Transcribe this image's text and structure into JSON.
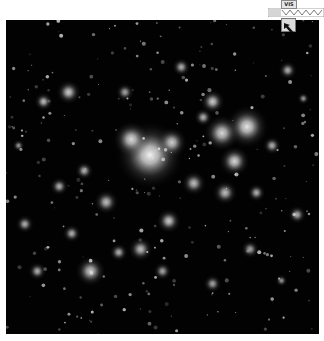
{
  "image": {
    "subject": "galaxy cluster deep-field",
    "colormap": "grayscale",
    "background_color": "#020202"
  },
  "overlay": {
    "label": "VIS",
    "cursor_icon": "pointer-arrow-icon"
  },
  "galaxies": [
    {
      "x": 0.46,
      "y": 0.43,
      "r": 0.11,
      "b": 0.95
    },
    {
      "x": 0.4,
      "y": 0.38,
      "r": 0.06,
      "b": 0.85
    },
    {
      "x": 0.53,
      "y": 0.39,
      "r": 0.05,
      "b": 0.8
    },
    {
      "x": 0.77,
      "y": 0.34,
      "r": 0.07,
      "b": 0.9
    },
    {
      "x": 0.69,
      "y": 0.36,
      "r": 0.06,
      "b": 0.85
    },
    {
      "x": 0.73,
      "y": 0.45,
      "r": 0.05,
      "b": 0.85
    },
    {
      "x": 0.66,
      "y": 0.26,
      "r": 0.04,
      "b": 0.8
    },
    {
      "x": 0.2,
      "y": 0.23,
      "r": 0.04,
      "b": 0.8
    },
    {
      "x": 0.12,
      "y": 0.26,
      "r": 0.03,
      "b": 0.75
    },
    {
      "x": 0.32,
      "y": 0.58,
      "r": 0.04,
      "b": 0.75
    },
    {
      "x": 0.52,
      "y": 0.64,
      "r": 0.04,
      "b": 0.8
    },
    {
      "x": 0.6,
      "y": 0.52,
      "r": 0.04,
      "b": 0.75
    },
    {
      "x": 0.7,
      "y": 0.55,
      "r": 0.04,
      "b": 0.75
    },
    {
      "x": 0.85,
      "y": 0.4,
      "r": 0.03,
      "b": 0.7
    },
    {
      "x": 0.63,
      "y": 0.31,
      "r": 0.03,
      "b": 0.7
    },
    {
      "x": 0.27,
      "y": 0.8,
      "r": 0.05,
      "b": 0.8
    },
    {
      "x": 0.43,
      "y": 0.73,
      "r": 0.04,
      "b": 0.75
    },
    {
      "x": 0.36,
      "y": 0.74,
      "r": 0.03,
      "b": 0.7
    },
    {
      "x": 0.17,
      "y": 0.53,
      "r": 0.03,
      "b": 0.7
    },
    {
      "x": 0.06,
      "y": 0.65,
      "r": 0.03,
      "b": 0.7
    },
    {
      "x": 0.1,
      "y": 0.8,
      "r": 0.03,
      "b": 0.7
    },
    {
      "x": 0.93,
      "y": 0.62,
      "r": 0.03,
      "b": 0.7
    },
    {
      "x": 0.8,
      "y": 0.55,
      "r": 0.03,
      "b": 0.7
    },
    {
      "x": 0.25,
      "y": 0.48,
      "r": 0.03,
      "b": 0.7
    },
    {
      "x": 0.21,
      "y": 0.68,
      "r": 0.03,
      "b": 0.7
    },
    {
      "x": 0.9,
      "y": 0.16,
      "r": 0.03,
      "b": 0.7
    },
    {
      "x": 0.56,
      "y": 0.15,
      "r": 0.03,
      "b": 0.7
    },
    {
      "x": 0.38,
      "y": 0.23,
      "r": 0.03,
      "b": 0.65
    },
    {
      "x": 0.66,
      "y": 0.84,
      "r": 0.03,
      "b": 0.65
    },
    {
      "x": 0.5,
      "y": 0.8,
      "r": 0.03,
      "b": 0.65
    },
    {
      "x": 0.78,
      "y": 0.73,
      "r": 0.03,
      "b": 0.65
    },
    {
      "x": 0.88,
      "y": 0.83,
      "r": 0.02,
      "b": 0.6
    },
    {
      "x": 0.95,
      "y": 0.25,
      "r": 0.02,
      "b": 0.6
    },
    {
      "x": 0.04,
      "y": 0.4,
      "r": 0.02,
      "b": 0.6
    }
  ]
}
